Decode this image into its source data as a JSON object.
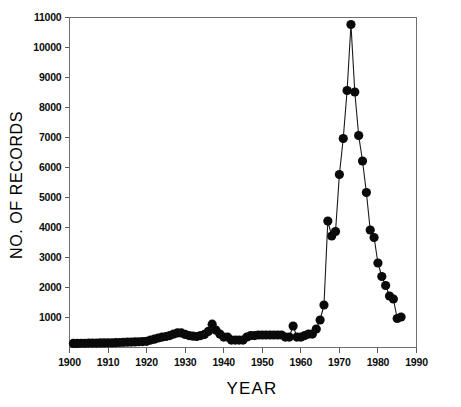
{
  "chart_data": {
    "type": "line",
    "title": "",
    "xlabel": "YEAR",
    "ylabel": "NO. OF RECORDS",
    "xlim": [
      1900,
      1990
    ],
    "ylim": [
      0,
      11000
    ],
    "xticks": [
      1900,
      1910,
      1920,
      1930,
      1940,
      1950,
      1960,
      1970,
      1980,
      1990
    ],
    "xtick_labels": [
      "1900",
      "1910",
      "1920",
      "1930",
      "1940",
      "1950",
      "1960",
      "1970",
      "1980",
      "1990"
    ],
    "yticks": [
      1000,
      2000,
      3000,
      4000,
      5000,
      6000,
      7000,
      8000,
      9000,
      10000,
      11000
    ],
    "ytick_labels": [
      "1000",
      "2000",
      "3000",
      "4000",
      "5000",
      "6000",
      "7000",
      "8000",
      "9000",
      "10000",
      "11000"
    ],
    "grid": false,
    "legend": null,
    "marker": "filled-circle",
    "marker_size": 4.6,
    "line_color": "#1a1a1a",
    "marker_color": "#0a0a0a",
    "axis_color": "#6f6f6f",
    "background_color": "#ffffff",
    "x": [
      1901,
      1902,
      1903,
      1904,
      1905,
      1906,
      1907,
      1908,
      1909,
      1910,
      1911,
      1912,
      1913,
      1914,
      1915,
      1916,
      1917,
      1918,
      1919,
      1920,
      1921,
      1922,
      1923,
      1924,
      1925,
      1926,
      1927,
      1928,
      1929,
      1930,
      1931,
      1932,
      1933,
      1934,
      1935,
      1936,
      1937,
      1938,
      1939,
      1940,
      1941,
      1942,
      1943,
      1944,
      1945,
      1946,
      1947,
      1948,
      1949,
      1950,
      1951,
      1952,
      1953,
      1954,
      1955,
      1956,
      1957,
      1958,
      1959,
      1960,
      1961,
      1962,
      1963,
      1964,
      1965,
      1966,
      1967,
      1968,
      1969,
      1970,
      1971,
      1972,
      1973,
      1974,
      1975,
      1976,
      1977,
      1978,
      1979,
      1980,
      1981,
      1982,
      1983,
      1984,
      1985,
      1986
    ],
    "y": [
      120,
      120,
      125,
      125,
      130,
      130,
      130,
      135,
      135,
      140,
      140,
      145,
      150,
      155,
      160,
      165,
      170,
      175,
      180,
      190,
      230,
      260,
      300,
      330,
      350,
      380,
      430,
      470,
      470,
      420,
      380,
      360,
      350,
      380,
      420,
      520,
      760,
      560,
      430,
      330,
      330,
      230,
      230,
      230,
      230,
      330,
      380,
      380,
      400,
      400,
      400,
      400,
      400,
      400,
      400,
      330,
      330,
      700,
      330,
      330,
      380,
      430,
      430,
      600,
      900,
      1400,
      4200,
      3700,
      3850,
      5750,
      6950,
      8550,
      10750,
      8500,
      7050,
      6200,
      5150,
      3900,
      3650,
      2800,
      2350,
      2050,
      1700,
      1600,
      950,
      1000
    ]
  },
  "axis_labels": {
    "y_axis_title": "NO. OF RECORDS",
    "x_axis_title": "YEAR"
  }
}
